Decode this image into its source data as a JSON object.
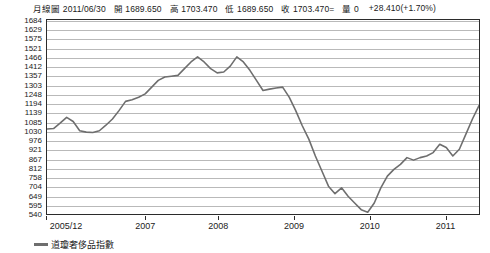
{
  "quote": {
    "chart_type_label": "月線圖",
    "date": "2011/06/30",
    "open_label": "開",
    "open": "1689.650",
    "high_label": "高",
    "high": "1703.470",
    "low_label": "低",
    "low": "1689.650",
    "close_label": "收",
    "close": "1703.470=",
    "volume_label": "量",
    "volume": "0",
    "change": "+28.410(+1.70%)"
  },
  "legend": {
    "series_label": "道瓊奢侈品指數",
    "line_color": "#6e6e6e"
  },
  "chart_data": {
    "type": "line",
    "title": "道瓊奢侈品指數",
    "xlabel": "",
    "ylabel": "",
    "grid": true,
    "legend_position": "bottom-left",
    "ylim": [
      540,
      1684
    ],
    "yticks": [
      1684,
      1629,
      1575,
      1521,
      1466,
      1412,
      1357,
      1303,
      1248,
      1194,
      1139,
      1085,
      1030,
      976,
      921,
      867,
      812,
      758,
      704,
      649,
      595,
      540
    ],
    "xticks": [
      "2005/12",
      "2007",
      "2008",
      "2009",
      "2010",
      "2011"
    ],
    "xtick_positions": [
      0,
      0.2286,
      0.3968,
      0.5714,
      0.746,
      0.9206
    ],
    "series": [
      {
        "name": "道瓊奢侈品指數",
        "color": "#6e6e6e",
        "x": [
          "2005/12",
          "2006/01",
          "2006/02",
          "2006/03",
          "2006/04",
          "2006/05",
          "2006/06",
          "2006/07",
          "2006/08",
          "2006/09",
          "2006/10",
          "2006/11",
          "2006/12",
          "2007/01",
          "2007/02",
          "2007/03",
          "2007/04",
          "2007/05",
          "2007/06",
          "2007/07",
          "2007/08",
          "2007/09",
          "2007/10",
          "2007/11",
          "2007/12",
          "2008/01",
          "2008/02",
          "2008/03",
          "2008/04",
          "2008/05",
          "2008/06",
          "2008/07",
          "2008/08",
          "2008/09",
          "2008/10",
          "2008/11",
          "2008/12",
          "2009/01",
          "2009/02",
          "2009/03",
          "2009/04",
          "2009/05",
          "2009/06",
          "2009/07",
          "2009/08",
          "2009/09",
          "2009/10",
          "2009/11",
          "2009/12",
          "2010/01",
          "2010/02",
          "2010/03",
          "2010/04",
          "2010/05",
          "2010/06",
          "2010/07",
          "2010/08",
          "2010/09",
          "2010/10",
          "2010/11",
          "2010/12",
          "2011/01",
          "2011/02",
          "2011/03",
          "2011/04",
          "2011/05",
          "2011/06"
        ],
        "values": [
          1040,
          1043,
          1075,
          1110,
          1085,
          1030,
          1022,
          1020,
          1030,
          1063,
          1100,
          1150,
          1205,
          1215,
          1230,
          1250,
          1290,
          1330,
          1350,
          1355,
          1360,
          1400,
          1440,
          1470,
          1440,
          1400,
          1375,
          1380,
          1415,
          1470,
          1440,
          1390,
          1330,
          1270,
          1278,
          1285,
          1290,
          1230,
          1150,
          1060,
          980,
          880,
          790,
          700,
          655,
          690,
          640,
          600,
          560,
          545,
          600,
          690,
          760,
          800,
          830,
          870,
          855,
          870,
          880,
          900,
          950,
          930,
          880,
          920,
          1010,
          1100,
          1180
        ],
        "annotations": [
          {
            "label": "pre-crisis peak",
            "value": 1470
          },
          {
            "label": "crisis trough",
            "value": 545
          },
          {
            "label": "latest close",
            "value": 1703.47
          }
        ]
      }
    ]
  }
}
